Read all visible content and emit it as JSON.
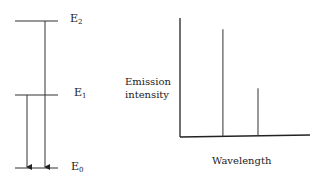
{
  "energy_diagram": {
    "levels": [
      {
        "id": "E2",
        "base": "E",
        "subscript": "2",
        "relative_energy": 2
      },
      {
        "id": "E1",
        "base": "E",
        "subscript": "1",
        "relative_energy": 1
      },
      {
        "id": "E0",
        "base": "E",
        "subscript": "0",
        "relative_energy": 0
      }
    ],
    "transitions": [
      {
        "from": "E2",
        "to": "E0"
      },
      {
        "from": "E1",
        "to": "E0"
      }
    ]
  },
  "spectrum": {
    "ylabel_line1": "Emission",
    "ylabel_line2": "intensity",
    "xlabel": "Wavelength"
  },
  "chart_data": {
    "type": "bar",
    "title": "",
    "xlabel": "Wavelength",
    "ylabel": "Emission intensity",
    "categories": [
      "E2→E0 line",
      "E1→E0 line"
    ],
    "x": [
      0.33,
      0.6
    ],
    "values": [
      0.9,
      0.4
    ],
    "xlim": [
      0,
      1
    ],
    "ylim": [
      0,
      1
    ],
    "grid": false,
    "legend": "none"
  },
  "colors": {
    "line": "#333333",
    "background": "#ffffff"
  }
}
